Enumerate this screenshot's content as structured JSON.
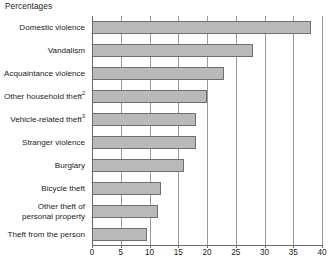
{
  "chart_data": {
    "type": "bar",
    "orientation": "horizontal",
    "title": "",
    "ylabel": "",
    "xlabel": "Percentages",
    "axis_title": "Percentages",
    "xlim": [
      0,
      40
    ],
    "xticks": [
      0,
      5,
      10,
      15,
      20,
      25,
      30,
      35,
      40
    ],
    "tick_labels": [
      "0",
      "5",
      "10",
      "15",
      "20",
      "25",
      "30",
      "35",
      "40"
    ],
    "grid": true,
    "grid_axis": "x",
    "legend": "none",
    "categories": [
      "Domestic violence",
      "Vandalism",
      "Acquaintance violence",
      "Other household theft",
      "Vehicle-related theft",
      "Stranger violence",
      "Burglary",
      "Bicycle theft",
      "Other theft of\npersonal property",
      "Theft from the person"
    ],
    "category_footnotes": [
      "",
      "",
      "",
      "2",
      "3",
      "",
      "",
      "",
      "",
      ""
    ],
    "values": [
      38,
      28,
      23,
      20,
      18,
      18,
      16,
      12,
      11.5,
      9.5
    ],
    "bar_color": "#b9b9b9",
    "bar_border_color": "#6f6f6f",
    "grid_color": "#9a9a9a",
    "axis_color": "#6a6a6a"
  }
}
